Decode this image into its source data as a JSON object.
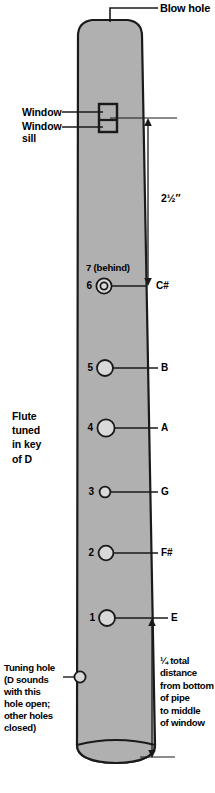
{
  "diagram": {
    "body_fill": "#b0b0b0",
    "outline": "#1a1a1a",
    "hole_fill": "#d9d9d9"
  },
  "callouts": {
    "blow_hole": "Blow hole",
    "window": "Window",
    "window_sill": "Window\nsill",
    "flute_key": "Flute\ntuned\nin key\nof D",
    "tuning_hole": "Tuning hole\n(D sounds\nwith this\nhole open;\nother holes\nclosed)"
  },
  "dimensions": {
    "top": "2½″",
    "bottom": "¼ total\ndistance\nfrom bottom\nof pipe\nto middle\nof window"
  },
  "holes": [
    {
      "number": "7",
      "behind_label": "7 (behind)",
      "note": "",
      "behind": true
    },
    {
      "number": "6",
      "note": "C#"
    },
    {
      "number": "5",
      "note": "B"
    },
    {
      "number": "4",
      "note": "A"
    },
    {
      "number": "3",
      "note": "G"
    },
    {
      "number": "2",
      "note": "F#"
    },
    {
      "number": "1",
      "note": "E"
    }
  ]
}
